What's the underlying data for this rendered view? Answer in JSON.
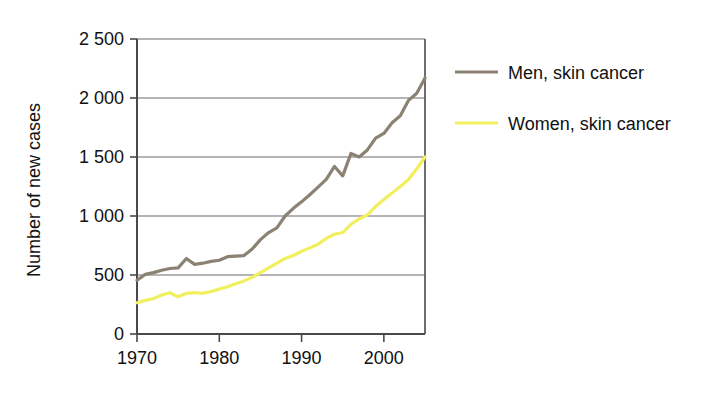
{
  "chart_data": {
    "type": "line",
    "title": "",
    "xlabel": "",
    "ylabel": "Number of new cases",
    "xlim": [
      1970,
      2005
    ],
    "ylim": [
      0,
      2500
    ],
    "xticks": [
      "1970",
      "1980",
      "1990",
      "2000"
    ],
    "xtick_values": [
      1970,
      1980,
      1990,
      2000
    ],
    "yticks": [
      "0",
      "500",
      "1 000",
      "1 500",
      "2 000",
      "2 500"
    ],
    "ytick_values": [
      0,
      500,
      1000,
      1500,
      2000,
      2500
    ],
    "grid": "horizontal",
    "legend_position": "right",
    "x": [
      1970,
      1971,
      1972,
      1973,
      1974,
      1975,
      1976,
      1977,
      1978,
      1979,
      1980,
      1981,
      1982,
      1983,
      1984,
      1985,
      1986,
      1987,
      1988,
      1989,
      1990,
      1991,
      1992,
      1993,
      1994,
      1995,
      1996,
      1997,
      1998,
      1999,
      2000,
      2001,
      2002,
      2003,
      2004,
      2005
    ],
    "series": [
      {
        "name": "Men, skin cancer",
        "color": "#8c8274",
        "values": [
          455,
          505,
          520,
          540,
          555,
          560,
          640,
          590,
          600,
          615,
          625,
          655,
          660,
          665,
          720,
          800,
          860,
          900,
          1000,
          1065,
          1120,
          1180,
          1245,
          1310,
          1420,
          1340,
          1530,
          1500,
          1560,
          1660,
          1700,
          1790,
          1850,
          1980,
          2040,
          2170
        ]
      },
      {
        "name": "Women, skin cancer",
        "color": "#f2ef5e",
        "values": [
          265,
          285,
          300,
          330,
          350,
          315,
          345,
          350,
          345,
          360,
          380,
          400,
          425,
          450,
          480,
          520,
          560,
          600,
          640,
          665,
          700,
          730,
          760,
          810,
          845,
          860,
          930,
          975,
          1010,
          1080,
          1140,
          1195,
          1250,
          1310,
          1400,
          1500
        ]
      }
    ]
  },
  "legend": {
    "items": [
      {
        "label": "Men, skin cancer",
        "color": "#8c8274"
      },
      {
        "label": "Women, skin cancer",
        "color": "#f2ef5e"
      }
    ]
  },
  "axes": {
    "y_title": "Number of new cases",
    "axis_color": "#4a4a4a",
    "grid_color": "#6b6b6b"
  }
}
